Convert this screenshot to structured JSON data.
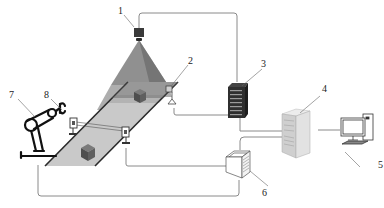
{
  "diagram": {
    "type": "system-schematic",
    "colors": {
      "line": "#8a8a8a",
      "belt": "#c9c9c9",
      "belt_edge": "#2a2a2a",
      "cone": "#7d7d7d",
      "cone_shadow": "#5e5e5e",
      "box": "#5a5a5a",
      "device_dark": "#2f2f2f",
      "server": "#d9d9d9",
      "text": "#222222"
    },
    "labels": [
      {
        "id": "1",
        "text": "1",
        "component": "camera"
      },
      {
        "id": "2",
        "text": "2",
        "component": "photoelectric-sensor"
      },
      {
        "id": "3",
        "text": "3",
        "component": "network-switch-rack"
      },
      {
        "id": "4",
        "text": "4",
        "component": "server"
      },
      {
        "id": "5",
        "text": "5",
        "component": "computer"
      },
      {
        "id": "6",
        "text": "6",
        "component": "controller"
      },
      {
        "id": "7",
        "text": "7",
        "component": "robot-arm"
      },
      {
        "id": "8",
        "text": "8",
        "component": "gripper"
      }
    ]
  }
}
